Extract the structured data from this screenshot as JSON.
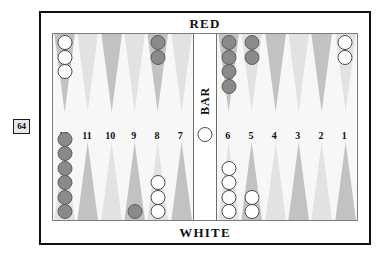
{
  "doubling_cube": {
    "value": "64"
  },
  "board": {
    "top_player_label": "RED",
    "bottom_player_label": "WHITE",
    "bar_label": "BAR",
    "point_numbers_left": [
      "12",
      "11",
      "10",
      "9",
      "8",
      "7"
    ],
    "point_numbers_right": [
      "6",
      "5",
      "4",
      "3",
      "2",
      "1"
    ],
    "colors": {
      "frame": "#111111",
      "field_background": "#f7f7f7",
      "triangle_dark": "#c2c2c2",
      "triangle_light": "#e2e2e2",
      "checker_white": "#ffffff",
      "checker_red": "#8a8a8a"
    }
  },
  "chart_data": {
    "type": "table",
    "columns": [
      "point",
      "quadrant",
      "color",
      "count"
    ],
    "rows": [
      [
        "12",
        "top",
        "white",
        3
      ],
      [
        "11",
        "top",
        "",
        0
      ],
      [
        "10",
        "top",
        "",
        0
      ],
      [
        "9",
        "top",
        "",
        0
      ],
      [
        "8",
        "top",
        "red",
        2
      ],
      [
        "7",
        "top",
        "",
        0
      ],
      [
        "6",
        "top",
        "red",
        4
      ],
      [
        "5",
        "top",
        "red",
        2
      ],
      [
        "4",
        "top",
        "",
        0
      ],
      [
        "3",
        "top",
        "",
        0
      ],
      [
        "2",
        "top",
        "",
        0
      ],
      [
        "1",
        "top",
        "white",
        2
      ],
      [
        "12",
        "bottom",
        "red",
        6
      ],
      [
        "11",
        "bottom",
        "",
        0
      ],
      [
        "10",
        "bottom",
        "",
        0
      ],
      [
        "9",
        "bottom",
        "red",
        1
      ],
      [
        "8",
        "bottom",
        "white",
        3
      ],
      [
        "7",
        "bottom",
        "",
        0
      ],
      [
        "6",
        "bottom",
        "white",
        4
      ],
      [
        "5",
        "bottom",
        "white",
        2
      ],
      [
        "4",
        "bottom",
        "",
        0
      ],
      [
        "3",
        "bottom",
        "",
        0
      ],
      [
        "2",
        "bottom",
        "",
        0
      ],
      [
        "1",
        "bottom",
        "",
        0
      ],
      [
        "bar",
        "bar",
        "white",
        1
      ]
    ]
  },
  "points": {
    "top_left": [
      {
        "n": "12",
        "color": "white",
        "count": 3
      },
      {
        "n": "11",
        "color": null,
        "count": 0
      },
      {
        "n": "10",
        "color": null,
        "count": 0
      },
      {
        "n": "9",
        "color": null,
        "count": 0
      },
      {
        "n": "8",
        "color": "red",
        "count": 2
      },
      {
        "n": "7",
        "color": null,
        "count": 0
      }
    ],
    "top_right": [
      {
        "n": "6",
        "color": "red",
        "count": 4
      },
      {
        "n": "5",
        "color": "red",
        "count": 2
      },
      {
        "n": "4",
        "color": null,
        "count": 0
      },
      {
        "n": "3",
        "color": null,
        "count": 0
      },
      {
        "n": "2",
        "color": null,
        "count": 0
      },
      {
        "n": "1",
        "color": "white",
        "count": 2
      }
    ],
    "bottom_left": [
      {
        "n": "12",
        "color": "red",
        "count": 6
      },
      {
        "n": "11",
        "color": null,
        "count": 0
      },
      {
        "n": "10",
        "color": null,
        "count": 0
      },
      {
        "n": "9",
        "color": "red",
        "count": 1
      },
      {
        "n": "8",
        "color": "white",
        "count": 3
      },
      {
        "n": "7",
        "color": null,
        "count": 0
      }
    ],
    "bottom_right": [
      {
        "n": "6",
        "color": "white",
        "count": 4
      },
      {
        "n": "5",
        "color": "white",
        "count": 2
      },
      {
        "n": "4",
        "color": null,
        "count": 0
      },
      {
        "n": "3",
        "color": null,
        "count": 0
      },
      {
        "n": "2",
        "color": null,
        "count": 0
      },
      {
        "n": "1",
        "color": null,
        "count": 0
      }
    ],
    "bar": [
      {
        "n": "bar",
        "color": "white",
        "count": 1
      }
    ]
  }
}
